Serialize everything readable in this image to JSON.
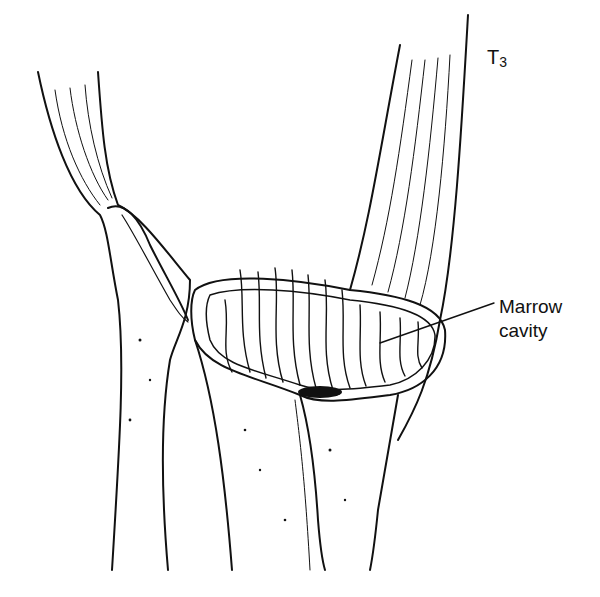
{
  "figure": {
    "labels": {
      "stage": {
        "main": "T",
        "sub": "3"
      },
      "marrow_line1": "Marrow",
      "marrow_line2": "cavity"
    },
    "colors": {
      "ink": "#111111",
      "background": "#ffffff"
    }
  }
}
